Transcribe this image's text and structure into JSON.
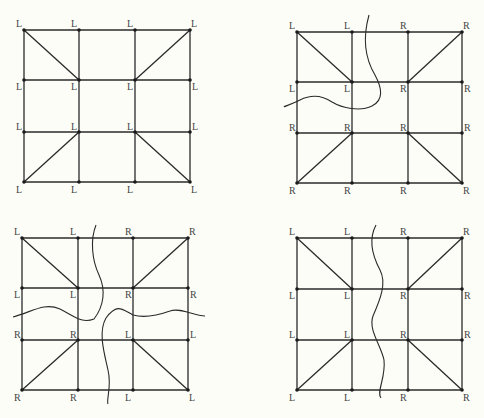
{
  "colors": {
    "ink": "#2a2a2a",
    "label": "#444444",
    "background": "#fdfdf8"
  },
  "grid_cols": 4,
  "grid_rows": 4,
  "diagonals_desc": "corner cells: top-left cell diag from top-left corner to inner node; top-right cell diag from top-right corner to inner node; bottom-left cell diag from bottom-left corner to inner node; bottom-right cell diag from bottom-right corner to inner node",
  "panels": [
    {
      "id": "top-left",
      "xs": [
        24,
        79,
        135,
        190
      ],
      "ys": [
        30,
        80,
        132,
        182
      ],
      "labels": [
        [
          "L",
          "L",
          "L",
          "L"
        ],
        [
          "L",
          "L",
          "L",
          "L"
        ],
        [
          "L",
          "L",
          "L",
          "L"
        ],
        [
          "L",
          "L",
          "L",
          "L"
        ]
      ],
      "curves": []
    },
    {
      "id": "top-right",
      "xs": [
        297,
        352,
        408,
        462
      ],
      "ys": [
        32,
        82,
        133,
        183
      ],
      "labels": [
        [
          "L",
          "L",
          "R",
          "R"
        ],
        [
          "L",
          "L",
          "R",
          "R"
        ],
        [
          "R",
          "R",
          "R",
          "R"
        ],
        [
          "R",
          "R",
          "R",
          "R"
        ]
      ],
      "curves": [
        "M 369 15 C 362 40, 366 60, 375 75 C 382 88, 384 100, 372 106 C 360 112, 342 108, 332 102 C 320 94, 310 95, 300 100 C 290 105, 280 108, 286 106"
      ]
    },
    {
      "id": "bottom-left",
      "xs": [
        22,
        78,
        133,
        188
      ],
      "ys": [
        238,
        288,
        340,
        390
      ],
      "labels": [
        [
          "L",
          "L",
          "R",
          "R"
        ],
        [
          "L",
          "L",
          "R",
          "R"
        ],
        [
          "R",
          "R",
          "L",
          "L"
        ],
        [
          "R",
          "R",
          "L",
          "L"
        ]
      ],
      "curves": [
        "M 96 225 C 90 240, 92 260, 99 275 C 106 290, 104 306, 94 319 C 82 324, 74 316, 60 309 C 44 302, 32 312, 13 317",
        "M 205 316 C 194 316, 180 307, 170 311 C 156 316, 144 318, 133 315 C 122 309, 117 303, 106 318 C 98 332, 104 352, 108 370 C 112 387, 106 400, 108 404"
      ]
    },
    {
      "id": "bottom-right",
      "xs": [
        297,
        352,
        408,
        462
      ],
      "ys": [
        238,
        289,
        340,
        390
      ],
      "labels": [
        [
          "L",
          "L",
          "R",
          "R"
        ],
        [
          "L",
          "L",
          "R",
          "R"
        ],
        [
          "L",
          "L",
          "R",
          "R"
        ],
        [
          "L",
          "L",
          "R",
          "R"
        ]
      ],
      "curves": [
        "M 376 225 C 368 240, 372 255, 380 270 C 387 283, 380 300, 373 316 C 368 330, 381 345, 384 360 C 386 378, 376 392, 381 398"
      ]
    }
  ]
}
